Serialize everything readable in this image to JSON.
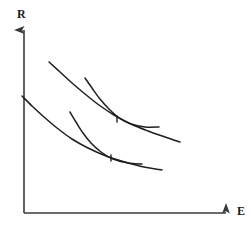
{
  "figure": {
    "title": "",
    "kind": "line-diagram",
    "background_color": "#ffffff",
    "line_color": "#1f1f1f",
    "axis_color": "#3a3a3a"
  },
  "axes": {
    "vertical": {
      "label": "R",
      "label_name": "y-axis-label",
      "arrowhead": true,
      "origin": {
        "x": 24,
        "y": 213
      },
      "tip": {
        "x": 24,
        "y": 26
      }
    },
    "horizontal": {
      "label": "E",
      "label_name": "x-axis-label",
      "arrowhead": true,
      "origin": {
        "x": 24,
        "y": 213
      },
      "tip": {
        "x": 232,
        "y": 213
      }
    },
    "ticks": [],
    "gridlines": false
  },
  "chart_data": {
    "type": "line",
    "title": "",
    "xlabel": "E",
    "ylabel": "R",
    "grid": false,
    "legend": "none",
    "xlim": [
      0,
      251
    ],
    "ylim": [
      231,
      0
    ],
    "annotations": [
      {
        "name": "upper-tangency-mark",
        "kind": "tick-mark",
        "x": 117,
        "y": 117,
        "label": ""
      },
      {
        "name": "lower-tangency-mark",
        "kind": "tick-mark",
        "x": 111,
        "y": 156,
        "label": ""
      }
    ],
    "series": [
      {
        "name": "upper-long-curve",
        "role": "indifference-curve-upper",
        "points": [
          [
            49,
            62
          ],
          [
            60,
            72
          ],
          [
            72,
            83
          ],
          [
            85,
            94
          ],
          [
            99,
            105
          ],
          [
            114,
            115
          ],
          [
            131,
            124
          ],
          [
            148,
            131
          ],
          [
            165,
            137
          ],
          [
            180,
            142
          ]
        ]
      },
      {
        "name": "upper-short-curve",
        "role": "budget-curve-upper",
        "points": [
          [
            85,
            78
          ],
          [
            92,
            88
          ],
          [
            100,
            99
          ],
          [
            109,
            109
          ],
          [
            119,
            118
          ],
          [
            131,
            124
          ],
          [
            145,
            127
          ],
          [
            159,
            127
          ]
        ]
      },
      {
        "name": "lower-long-curve",
        "role": "indifference-curve-lower",
        "points": [
          [
            22,
            96
          ],
          [
            32,
            106
          ],
          [
            44,
            117
          ],
          [
            57,
            128
          ],
          [
            72,
            139
          ],
          [
            88,
            148
          ],
          [
            106,
            156
          ],
          [
            125,
            162
          ],
          [
            144,
            167
          ],
          [
            162,
            170
          ]
        ]
      },
      {
        "name": "lower-short-curve",
        "role": "budget-curve-lower",
        "points": [
          [
            70,
            112
          ],
          [
            76,
            122
          ],
          [
            83,
            133
          ],
          [
            91,
            143
          ],
          [
            101,
            152
          ],
          [
            113,
            159
          ],
          [
            128,
            163
          ],
          [
            142,
            164
          ]
        ]
      }
    ]
  }
}
